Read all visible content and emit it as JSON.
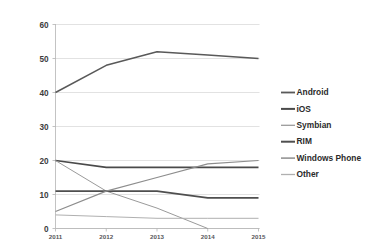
{
  "chart_data": {
    "type": "line",
    "title": "",
    "xlabel": "",
    "ylabel": "",
    "x": [
      "2011",
      "2012",
      "2013",
      "2014",
      "2015"
    ],
    "categories": [
      "2011",
      "2012",
      "2013",
      "2014",
      "2015"
    ],
    "ylim": [
      0,
      60
    ],
    "yticks": [
      0,
      10,
      20,
      30,
      40,
      50,
      60
    ],
    "ytick_labels": [
      "0",
      "10",
      "20",
      "30",
      "40",
      "50",
      "60"
    ],
    "grid": true,
    "legend_position": "right",
    "series": [
      {
        "name": "Android",
        "values": [
          40,
          48,
          52,
          51,
          50
        ],
        "color": "#595959",
        "width": 1.5
      },
      {
        "name": "iOS",
        "values": [
          20,
          18,
          18,
          18,
          18
        ],
        "color": "#4a4a4a",
        "width": 1.7
      },
      {
        "name": "Symbian",
        "values": [
          20,
          11,
          6,
          0,
          null
        ],
        "color": "#9a9a9a",
        "width": 1.0
      },
      {
        "name": "RIM",
        "values": [
          11,
          11,
          11,
          9,
          9
        ],
        "color": "#4f4f4f",
        "width": 1.7
      },
      {
        "name": "Windows Phone",
        "values": [
          5,
          11,
          15,
          19,
          20
        ],
        "color": "#8d8d8d",
        "width": 1.2
      },
      {
        "name": "Other",
        "values": [
          4,
          3.5,
          3,
          3,
          3
        ],
        "color": "#b0b0b0",
        "width": 1.0
      }
    ]
  },
  "legend": {
    "items": [
      {
        "label": "Android",
        "color": "#595959"
      },
      {
        "label": "iOS",
        "color": "#4a4a4a"
      },
      {
        "label": "Symbian",
        "color": "#9a9a9a"
      },
      {
        "label": "RIM",
        "color": "#4f4f4f"
      },
      {
        "label": "Windows Phone",
        "color": "#8d8d8d"
      },
      {
        "label": "Other",
        "color": "#b0b0b0"
      }
    ]
  },
  "header": {
    "title": ""
  }
}
